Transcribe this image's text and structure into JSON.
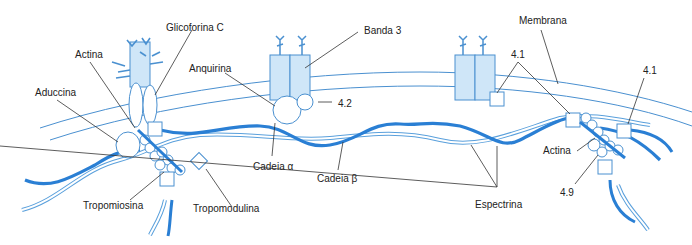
{
  "diagram": {
    "colors": {
      "spectrin_dark": "#2a7fd4",
      "spectrin_light_outline": "#5aa0dc",
      "protein_fill": "#cfe6f8",
      "protein_stroke": "#4a90d0",
      "membrane_line": "#4a90d0",
      "leader_line": "#333333",
      "label_text": "#222222"
    },
    "labels": {
      "glicoforina_c": "Glicoforina C",
      "actina_left": "Actina",
      "aduccina": "Aduccina",
      "anquirina": "Anquirina",
      "banda3": "Banda 3",
      "proteina_4_2": "4.2",
      "membrana": "Membrana",
      "proteina_4_1_middle": "4.1",
      "proteina_4_1_right": "4.1",
      "cadeia_alfa": "Cadeia α",
      "cadeia_beta": "Cadeia β",
      "tropomiosina": "Tropomiosina",
      "tropomodulina": "Tropomodulina",
      "espectrina": "Espectrina",
      "actina_right": "Actina",
      "proteina_4_9": "4.9"
    }
  }
}
